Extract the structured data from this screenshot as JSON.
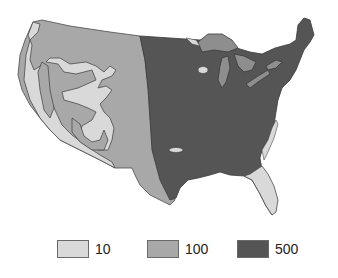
{
  "map": {
    "region": "Contiguous United States",
    "classes": [
      {
        "label": "10",
        "color": "#d9d9d9"
      },
      {
        "label": "100",
        "color": "#a8a8a8"
      },
      {
        "label": "500",
        "color": "#555555"
      }
    ]
  },
  "legend": {
    "items": [
      {
        "label": "10",
        "color": "#d9d9d9"
      },
      {
        "label": "100",
        "color": "#a8a8a8"
      },
      {
        "label": "500",
        "color": "#555555"
      }
    ]
  },
  "colors": {
    "outline": "#4a4a4a",
    "lakes": "#8e8e8e",
    "background": "#ffffff"
  }
}
